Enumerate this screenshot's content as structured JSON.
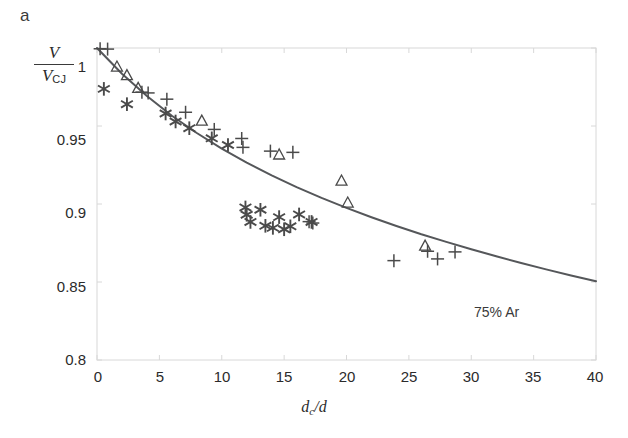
{
  "figure": {
    "panel_label": "a",
    "background_color": "#ffffff",
    "curve_color": "#55575a",
    "frame_color": "#d8d8d8",
    "marker_color": "#4a4a4a",
    "width": 628,
    "height": 438
  },
  "axes": {
    "y_label_numerator": "V",
    "y_label_denominator_base": "V",
    "y_label_denominator_sub": "CJ",
    "x_label_base": "d",
    "x_label_sub": "c",
    "x_label_tail": "/d"
  },
  "chart_data": {
    "type": "scatter",
    "title": "",
    "subtitle": "",
    "xlabel": "d_c/d",
    "ylabel": "V/V_CJ",
    "xlim": [
      0,
      40
    ],
    "ylim": [
      0.8,
      1.0
    ],
    "xticks": [
      0,
      5,
      10,
      15,
      20,
      25,
      30,
      35,
      40
    ],
    "xtick_labels": [
      "0",
      "5",
      "10",
      "15",
      "20",
      "25",
      "30",
      "35",
      "40"
    ],
    "yticks": [
      0.8,
      0.85,
      0.9,
      0.95,
      1
    ],
    "ytick_labels": [
      "0.8",
      "0.85",
      "0.9",
      "0.95",
      "1"
    ],
    "grid": false,
    "legend": false,
    "legend_position": "none",
    "annotations": [
      {
        "text": "75% Ar",
        "x": 30.6,
        "y": 0.8535
      }
    ],
    "series": [
      {
        "name": "fit-curve",
        "type": "line",
        "marker": "none",
        "color": "#55575a",
        "x": [
          0,
          2,
          4,
          6,
          8,
          10,
          12,
          14,
          16,
          18,
          20,
          22,
          24,
          26,
          28,
          30,
          32,
          34,
          36,
          38,
          40
        ],
        "y": [
          1.0,
          0.9835,
          0.9692,
          0.9566,
          0.9455,
          0.9355,
          0.9265,
          0.9183,
          0.9108,
          0.9039,
          0.8975,
          0.8915,
          0.8859,
          0.8806,
          0.8757,
          0.871,
          0.8665,
          0.8622,
          0.8581,
          0.8542,
          0.8505
        ]
      },
      {
        "name": "plus-markers",
        "type": "scatter",
        "marker": "plus",
        "color": "#4a4a4a",
        "x": [
          0.25,
          0.85,
          3.6,
          4.1,
          5.6,
          7.1,
          9.4,
          11.6,
          11.7,
          13.9,
          15.7,
          17.0,
          17.3,
          23.8,
          26.5,
          27.3,
          28.7
        ],
        "y": [
          0.9995,
          0.9993,
          0.9717,
          0.9712,
          0.9672,
          0.9588,
          0.9478,
          0.942,
          0.9363,
          0.9339,
          0.9331,
          0.8887,
          0.8878,
          0.8637,
          0.8697,
          0.8648,
          0.8693
        ]
      },
      {
        "name": "triangle-markers",
        "type": "scatter",
        "marker": "triangle",
        "color": "#4a4a4a",
        "x": [
          1.6,
          2.4,
          3.3,
          8.4,
          14.6,
          19.6,
          20.1,
          26.3
        ],
        "y": [
          0.9877,
          0.9822,
          0.974,
          0.953,
          0.9313,
          0.9146,
          0.9005,
          0.8729
        ]
      },
      {
        "name": "asterisk-markers",
        "type": "scatter",
        "marker": "asterisk",
        "color": "#4a4a4a",
        "x": [
          0.55,
          2.4,
          5.5,
          6.3,
          7.4,
          9.2,
          10.5,
          11.9,
          12.0,
          12.3,
          13.1,
          13.5,
          14.1,
          14.6,
          15.0,
          15.5,
          16.2,
          17.2
        ],
        "y": [
          0.9738,
          0.964,
          0.958,
          0.9529,
          0.9486,
          0.9421,
          0.9378,
          0.8978,
          0.8931,
          0.8885,
          0.8963,
          0.886,
          0.8847,
          0.8916,
          0.8838,
          0.8857,
          0.8933,
          0.8885
        ]
      }
    ]
  },
  "tick_labels": {
    "y": [
      "1",
      "0.95",
      "0.9",
      "0.85",
      "0.8"
    ],
    "x": [
      "0",
      "5",
      "10",
      "15",
      "20",
      "25",
      "30",
      "35",
      "40"
    ]
  }
}
